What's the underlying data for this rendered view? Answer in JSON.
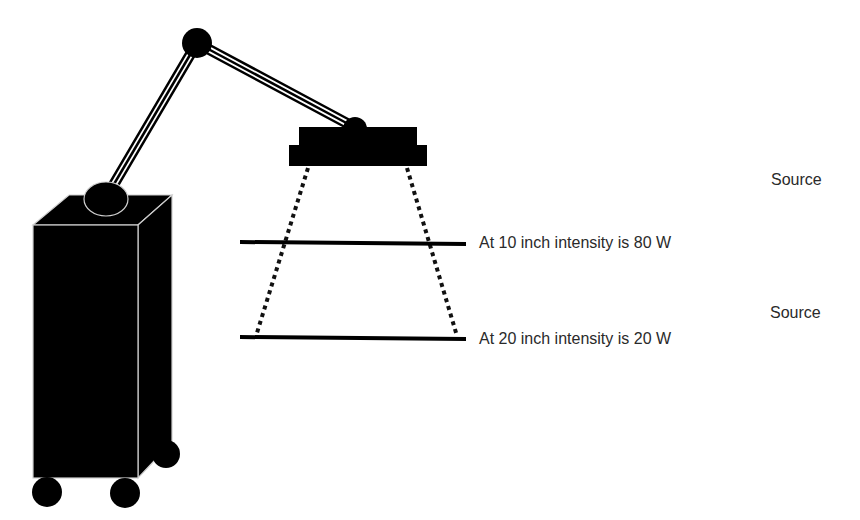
{
  "diagram": {
    "type": "inverse-square-law-illustration",
    "device": {
      "name": "heat lamp on articulated arm with wheeled base cart",
      "base_color": "#000000",
      "outline_color": "#cfcfcf"
    },
    "beam": {
      "style": "dotted",
      "color": "#111111"
    },
    "measurement_lines": [
      {
        "distance": "10 inch",
        "intensity": "80 W",
        "label": "At 10 inch intensity is 80 W"
      },
      {
        "distance": "20 inch",
        "intensity": "20 W",
        "label": "At 20 inch intensity is 20 W"
      }
    ],
    "side_labels": [
      "Source",
      "Source"
    ],
    "colors": {
      "ink": "#000000",
      "text": "#2a2a2a",
      "background": "#ffffff"
    }
  }
}
